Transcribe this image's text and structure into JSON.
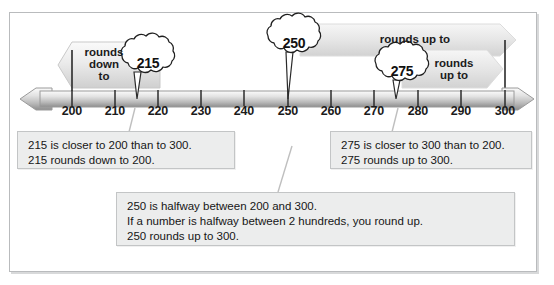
{
  "diagram": {
    "title_text": "",
    "numberline": {
      "ticks": [
        "200",
        "210",
        "220",
        "230",
        "240",
        "250",
        "260",
        "270",
        "280",
        "290",
        "300"
      ],
      "range_min": 200,
      "range_max": 300,
      "step": 10,
      "left_arrow_icon": "left-arrow-icon",
      "right_arrow_icon": "right-arrow-icon"
    },
    "endpoint_markers": [
      {
        "value": "200",
        "name": "endpoint-line-200"
      },
      {
        "value": "300",
        "name": "endpoint-line-300"
      }
    ],
    "banners": [
      {
        "id": "rounds-down-to",
        "text": "rounds\ndown\nto",
        "direction": "left",
        "from_value": 215,
        "to_value": 200
      },
      {
        "id": "rounds-up-to-250",
        "text": "rounds up to",
        "direction": "right",
        "from_value": 250,
        "to_value": 300
      },
      {
        "id": "rounds-up-to-275",
        "text": "rounds\nup to",
        "direction": "right",
        "from_value": 275,
        "to_value": 300
      }
    ],
    "bursts": [
      {
        "id": "burst-215",
        "value": "215",
        "points_to": 215
      },
      {
        "id": "burst-250",
        "value": "250",
        "points_to": 250
      },
      {
        "id": "burst-275",
        "value": "275",
        "points_to": 275
      }
    ],
    "notes": [
      {
        "id": "note-215",
        "lines": [
          "215 is closer to 200 than to 300.",
          "215 rounds down to 200."
        ]
      },
      {
        "id": "note-275",
        "lines": [
          "275 is closer to 300 than to 200.",
          "275 rounds up to 300."
        ]
      },
      {
        "id": "note-250",
        "lines": [
          "250 is halfway between 200 and 300.",
          "If a number is halfway between 2 hundreds, you round up.",
          "250 rounds up to 300."
        ]
      }
    ],
    "colors": {
      "frame_border": "#b9bbbd",
      "line_fill_light": "#f2f2f2",
      "line_fill_dark": "#b8b8b8",
      "banner_fill": "#e9e9e9",
      "note_fill": "#eceded",
      "note_border": "#c3c5c6",
      "text": "#1b1b1b"
    }
  }
}
